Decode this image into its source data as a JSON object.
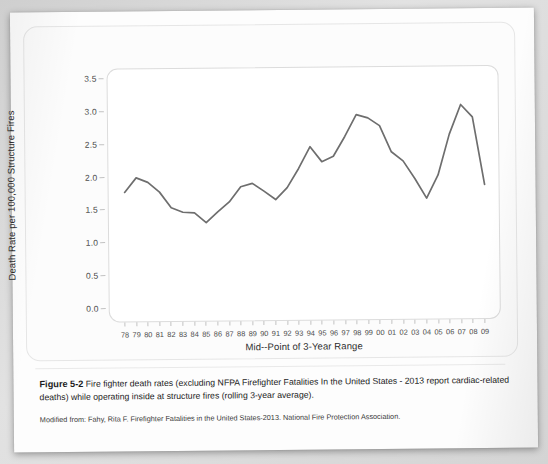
{
  "figure": {
    "number_label": "Figure 5-2",
    "caption": "Fire fighter death rates (excluding NFPA Firefighter Fatalities In the United States - 2013 report cardiac-related deaths) while operating inside at structure fires (rolling 3-year average).",
    "source": "Modified from: Fahy, Rita F. Firefighter Fatalities in the United States-2013. National Fire Protection Association."
  },
  "colors": {
    "line": "#6e6e6e",
    "panel_border": "#dcdcdc",
    "page": "#fdfdfd",
    "text": "#1c1c1c"
  },
  "chart_data": {
    "type": "line",
    "title": "",
    "xlabel": "Mid--Point of 3-Year Range",
    "ylabel": "Death Rate per 100,000 Structure Fires",
    "ylim": [
      0.0,
      3.5
    ],
    "yticks": [
      "0.0",
      "0.5",
      "1.0",
      "1.5",
      "2.0",
      "2.5",
      "3.0",
      "3.5"
    ],
    "ytick_values": [
      0.0,
      0.5,
      1.0,
      1.5,
      2.0,
      2.5,
      3.0,
      3.5
    ],
    "grid": false,
    "legend": "none",
    "categories": [
      "78",
      "79",
      "80",
      "81",
      "82",
      "83",
      "84",
      "85",
      "86",
      "87",
      "88",
      "89",
      "90",
      "91",
      "92",
      "93",
      "94",
      "95",
      "96",
      "97",
      "98",
      "99",
      "00",
      "01",
      "02",
      "03",
      "04",
      "05",
      "06",
      "07",
      "08",
      "09"
    ],
    "values": [
      1.78,
      2.0,
      1.93,
      1.78,
      1.54,
      1.47,
      1.46,
      1.31,
      1.47,
      1.62,
      1.85,
      1.9,
      1.78,
      1.65,
      1.83,
      2.12,
      2.45,
      2.22,
      2.3,
      2.6,
      2.93,
      2.88,
      2.76,
      2.36,
      2.22,
      1.95,
      1.65,
      2.0,
      2.62,
      3.07,
      2.88,
      1.85
    ]
  }
}
